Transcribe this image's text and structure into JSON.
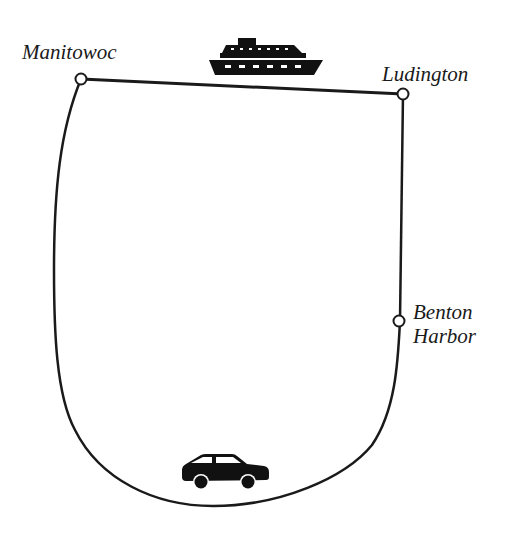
{
  "diagram": {
    "type": "route-map",
    "nodes": [
      {
        "id": "manitowoc",
        "label": "Manitowoc"
      },
      {
        "id": "ludington",
        "label": "Ludington"
      },
      {
        "id": "benton_harbor",
        "label_line1": "Benton",
        "label_line2": "Harbor"
      }
    ],
    "edges": [
      {
        "from": "manitowoc",
        "to": "ludington",
        "mode": "ferry",
        "icon": "ship-icon"
      },
      {
        "from": "ludington",
        "to": "benton_harbor",
        "mode": "car"
      },
      {
        "from": "benton_harbor",
        "to": "manitowoc",
        "mode": "car",
        "icon": "car-icon"
      }
    ],
    "colors": {
      "line": "#1a1a1a",
      "node_fill": "#ffffff",
      "icon_fill": "#111111",
      "background": "#ffffff"
    }
  }
}
